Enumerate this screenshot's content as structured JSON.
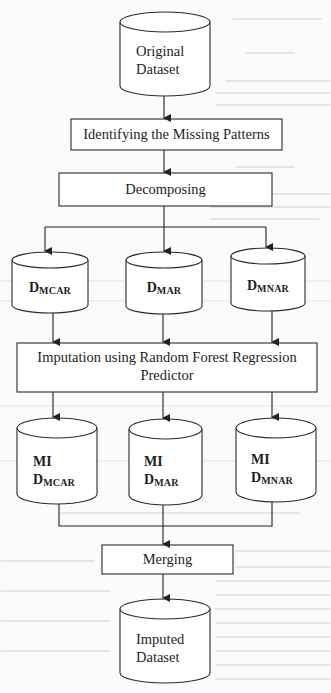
{
  "diagram": {
    "type": "flowchart",
    "colors": {
      "stroke": "#2a2a2a",
      "fill": "#ffffff",
      "background": "#fbfbf9"
    },
    "nodes": {
      "original_dataset": {
        "shape": "cylinder",
        "line1": "Original",
        "line2": "Dataset"
      },
      "identifying": {
        "shape": "rectangle",
        "label": "Identifying the Missing Patterns"
      },
      "decomposing": {
        "shape": "rectangle",
        "label": "Decomposing"
      },
      "d_mcar": {
        "shape": "cylinder",
        "main": "D",
        "sub": "MCAR"
      },
      "d_mar": {
        "shape": "cylinder",
        "main": "D",
        "sub": "MAR"
      },
      "d_mnar": {
        "shape": "cylinder",
        "main": "D",
        "sub": "MNAR"
      },
      "imputation": {
        "shape": "rectangle",
        "line1": "Imputation using Random Forest Regression",
        "line2": "Predictor"
      },
      "mi_d_mcar": {
        "shape": "cylinder",
        "prefix": "MI",
        "main": "D",
        "sub": "MCAR"
      },
      "mi_d_mar": {
        "shape": "cylinder",
        "prefix": "MI",
        "main": "D",
        "sub": "MAR"
      },
      "mi_d_mnar": {
        "shape": "cylinder",
        "prefix": "MI",
        "main": "D",
        "sub": "MNAR"
      },
      "merging": {
        "shape": "rectangle",
        "label": "Merging"
      },
      "imputed_dataset": {
        "shape": "cylinder",
        "line1": "Imputed",
        "line2": "Dataset"
      }
    },
    "edges": [
      [
        "original_dataset",
        "identifying"
      ],
      [
        "identifying",
        "decomposing"
      ],
      [
        "decomposing",
        "d_mcar"
      ],
      [
        "decomposing",
        "d_mar"
      ],
      [
        "decomposing",
        "d_mnar"
      ],
      [
        "d_mcar",
        "imputation"
      ],
      [
        "d_mar",
        "imputation"
      ],
      [
        "d_mnar",
        "imputation"
      ],
      [
        "imputation",
        "mi_d_mcar"
      ],
      [
        "imputation",
        "mi_d_mar"
      ],
      [
        "imputation",
        "mi_d_mnar"
      ],
      [
        "mi_d_mcar",
        "merging"
      ],
      [
        "mi_d_mar",
        "merging"
      ],
      [
        "mi_d_mnar",
        "merging"
      ],
      [
        "merging",
        "imputed_dataset"
      ]
    ]
  }
}
